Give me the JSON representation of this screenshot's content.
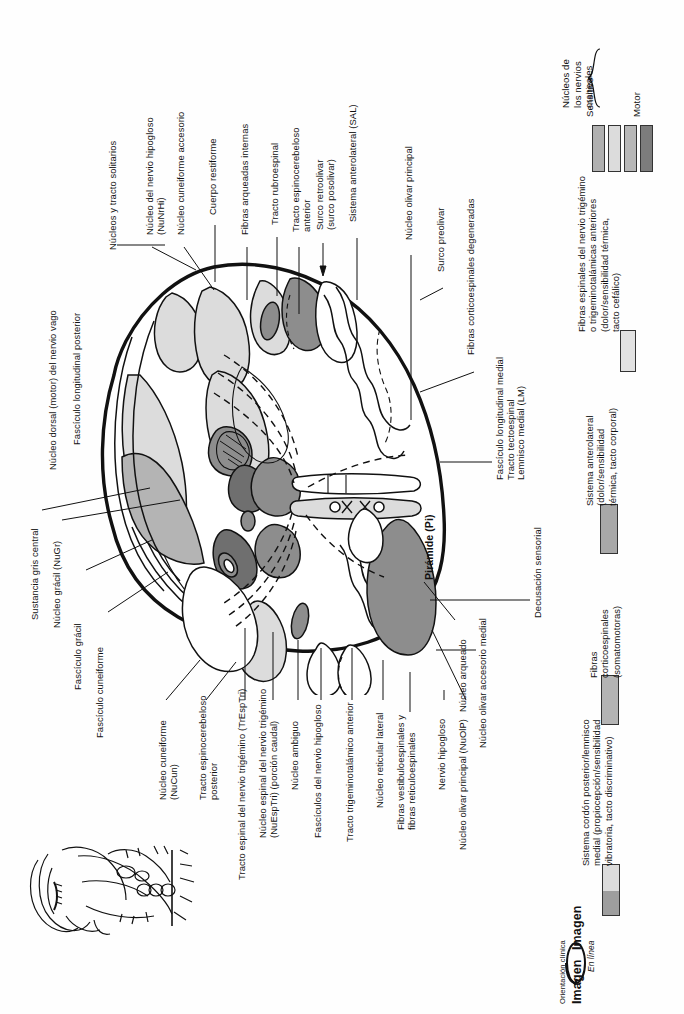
{
  "figure": {
    "orientation": "rotated-90",
    "main_structure_label": "Pirámide (Pi)"
  },
  "labels_top": [
    {
      "id": "nucleo-dorsal-vago",
      "text": "Núcleo dorsal (motor) del nervio vago"
    },
    {
      "id": "fasciculo-longitudinal-posterior",
      "text": "Fascículo longitudinal posterior"
    },
    {
      "id": "nucleos-tracto-solitarios",
      "text": "Núcleos y tracto solitarios"
    },
    {
      "id": "nucleo-nervio-hipogloso",
      "text": "Núcleo del nervio hipogloso\n(NuNrHi)"
    },
    {
      "id": "nucleo-cuneiforme-accesorio",
      "text": "Núcleo cuneiforme accesorio"
    },
    {
      "id": "cuerpo-restiforme",
      "text": "Cuerpo restiforme"
    },
    {
      "id": "fibras-arqueadas-internas",
      "text": "Fibras arqueadas internas"
    },
    {
      "id": "tracto-rubroespinal",
      "text": "Tracto rubroespinal"
    },
    {
      "id": "tracto-espinocerebeloso-anterior",
      "text": "Tracto espinocerebeloso\nanterior"
    },
    {
      "id": "surco-retroolivar",
      "text": "Surco retroolivar\n(surco posolivar)"
    },
    {
      "id": "sistema-anterolateral-sal",
      "text": "Sistema anterolateral (SAL)"
    },
    {
      "id": "nucleo-olivar-principal",
      "text": "Núcleo olivar principal"
    },
    {
      "id": "surco-preolivar",
      "text": "Surco preolivar"
    },
    {
      "id": "fibras-corticoespinales-degeneradas",
      "text": "Fibras corticoespinales degeneradas"
    }
  ],
  "labels_right": [
    {
      "id": "flm-tectoespinal-lm",
      "text": "Fascículo longitudinal medial\nTracto tectoespinal\nLemnisco medial (LM)"
    },
    {
      "id": "decusacion-sensorial",
      "text": "Decusación sensorial"
    },
    {
      "id": "nucleo-olivar-accesorio-medial",
      "text": "Núcleo olivar accesorio medial"
    },
    {
      "id": "nucleo-arqueado",
      "text": "Núcleo arqueado"
    }
  ],
  "labels_bottom": [
    {
      "id": "nucleo-olivar-principal-nuolp",
      "text": "Núcleo olivar principal (NuOlP)"
    },
    {
      "id": "nervio-hipogloso",
      "text": "Nervio hipogloso"
    },
    {
      "id": "fibras-vestibuloespinales",
      "text": "Fibras vestibuloespinales y\nfibras reticuloespinales"
    },
    {
      "id": "nucleo-reticular-lateral",
      "text": "Núcleo reticular lateral"
    },
    {
      "id": "tracto-trigeminotalamico-anterior",
      "text": "Tracto trigeminotalámico anterior"
    },
    {
      "id": "fasciculos-nervio-hipogloso",
      "text": "Fascículos del nervio hipogloso"
    },
    {
      "id": "nucleo-ambiguo",
      "text": "Núcleo ambiguo"
    },
    {
      "id": "nucleo-espinal-trigemino",
      "text": "Núcleo espinal del nervio trigémino\n(NuEspTri) (porción caudal)"
    },
    {
      "id": "tracto-espinal-trigemino",
      "text": "Tracto espinal del nervio trigémino (TrEspTri)"
    },
    {
      "id": "tracto-espinocerebeloso-posterior",
      "text": "Tracto espinocerebeloso\nposterior"
    },
    {
      "id": "nucleo-cuneiforme-nucun",
      "text": "Núcleo cuneiforme\n(NuCun)"
    }
  ],
  "labels_left": [
    {
      "id": "sustancia-gris-central",
      "text": "Sustancia gris central"
    },
    {
      "id": "nucleo-gracil",
      "text": "Núcleo grácil (NuGr)"
    },
    {
      "id": "fasciculo-gracil",
      "text": "Fascículo grácil"
    },
    {
      "id": "fasciculo-cuneiforme",
      "text": "Fascículo cuneiforme"
    }
  ],
  "legend": {
    "cranial_nuclei": {
      "bracket_label": "Núcleos de\nlos nervios\ncraneales",
      "sensory_label": "Sensitivo",
      "motor_label": "Motor",
      "swatches": [
        "#b0b0b0",
        "#dcdcdc",
        "#b8b8b8",
        "#7c7c7c"
      ]
    },
    "entries": [
      {
        "id": "fibras-espinales-trigemino",
        "text": "Fibras espinales del nervio trigémino\no trigeminotalámicas anteriores\n(dolor/sensibilidad térmica,\ntacto cefálico)",
        "color": "#e2e2e2"
      },
      {
        "id": "sistema-anterolateral",
        "text": "Sistema anterolateral\n(dolor/sensibilidad\ntérmica, tacto corporal)",
        "color": "#a8a8a8"
      },
      {
        "id": "fibras-corticoespinales",
        "text": "Fibras\ncorticoespinales\n(somatomotoras)",
        "color": "#b4b4b4"
      },
      {
        "id": "sistema-cordon-posterior",
        "text": "Sistema cordón posterior/lemnisco\nmedial (propiocepción/sensibilidad\nvibratoria, tacto discriminativo)",
        "color_top": "#dcdcdc",
        "color_bottom": "#9e9e9e"
      }
    ]
  },
  "branding": {
    "clinical_orientation": "Orientación clínica",
    "brand_top": "Imagen",
    "brand_bottom": "Imagen",
    "online": "En línea"
  }
}
